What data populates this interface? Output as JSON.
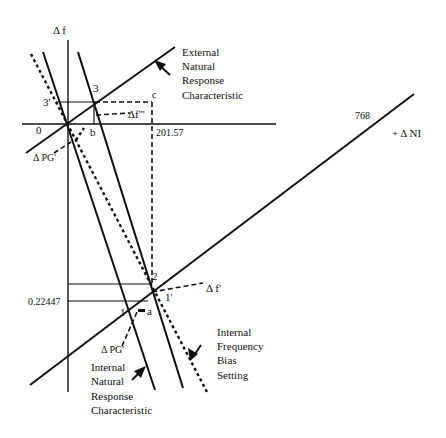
{
  "diagram": {
    "axes": {
      "y_label": "Δ f",
      "x_label": "+ Δ NI",
      "origin_label": "0"
    },
    "values": {
      "x_intercept_external": "768",
      "x_value_c": "201.57",
      "y_value_point1": "0.22447"
    },
    "points": {
      "p3": "3",
      "p3_prime": "3'",
      "p2": "2",
      "p1": "1",
      "p1_prime": "1'",
      "a": "a",
      "b": "b",
      "c": "c"
    },
    "deltas": {
      "delta_f_triple_prime": "Δf'''",
      "delta_f_prime": "Δ f'",
      "delta_pg_upper": "Δ PG'",
      "delta_pg_lower": "Δ PG'"
    },
    "annotations": {
      "external_natural_response": [
        "External",
        "Natural",
        "Response",
        "Characteristic"
      ],
      "internal_natural_response": [
        "Internal",
        "Natural",
        "Response",
        "Characteristic"
      ],
      "internal_frequency_bias": [
        "Internal",
        "Frequency",
        "Bias",
        "Setting"
      ]
    },
    "colors": {
      "line": "#111111",
      "background": "#ffffff"
    }
  }
}
